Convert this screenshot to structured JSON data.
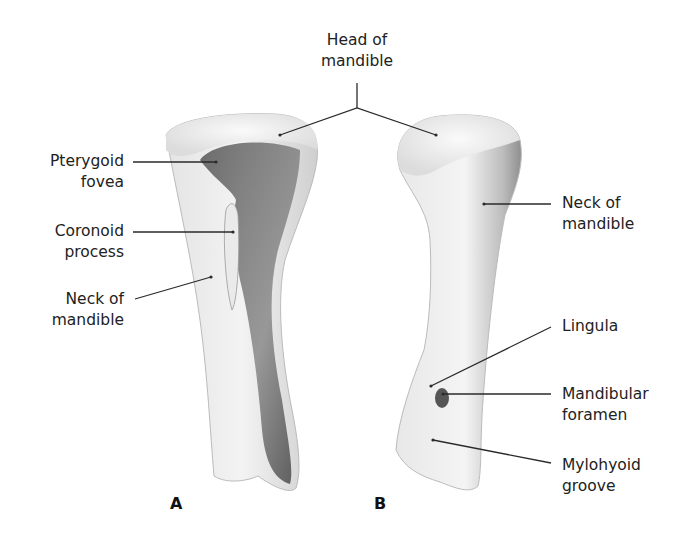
{
  "figure": {
    "panels": [
      {
        "id": "A",
        "label": "A"
      },
      {
        "id": "B",
        "label": "B"
      }
    ],
    "labels": {
      "head_of_mandible": {
        "line1": "Head of",
        "line2": "mandible"
      },
      "pterygoid_fovea": {
        "line1": "Pterygoid",
        "line2": "fovea"
      },
      "coronoid_process": {
        "line1": "Coronoid",
        "line2": "process"
      },
      "neck_of_mandible_a": {
        "line1": "Neck of",
        "line2": "mandible"
      },
      "neck_of_mandible_b": {
        "line1": "Neck of",
        "line2": "mandible"
      },
      "lingula": {
        "line1": "Lingula"
      },
      "mandibular_foramen": {
        "line1": "Mandibular",
        "line2": "foramen"
      },
      "mylohyoid_groove": {
        "line1": "Mylohyoid",
        "line2": "groove"
      }
    },
    "colors": {
      "text": "#222222",
      "leader": "#2a2a2a",
      "bone_light": "#f2f2f2",
      "bone_mid": "#c8c8c8",
      "bone_dark": "#5a5a5a"
    }
  }
}
